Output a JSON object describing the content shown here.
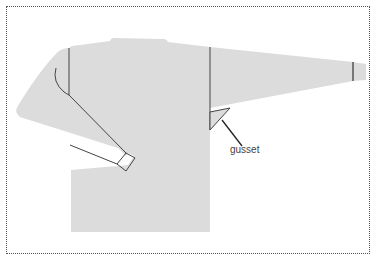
{
  "diagram": {
    "colors": {
      "garment_fill": "#dcdcdc",
      "line": "#444444",
      "frame": "#555555",
      "background": "#ffffff"
    },
    "parts": [
      "body",
      "neckline",
      "left-sleeve",
      "right-sleeve",
      "left-cuff",
      "right-cuff",
      "shoulder-seams",
      "gusset"
    ],
    "labels": [
      {
        "id": "gusset",
        "text": "gusset"
      }
    ]
  }
}
